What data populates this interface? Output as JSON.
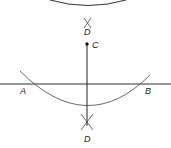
{
  "diagram": {
    "title": "",
    "labels": {
      "A": "A",
      "B": "B",
      "C": "C",
      "D_upper": "D",
      "D_lower": "D"
    },
    "colors": {
      "stroke": "#333333",
      "background": "#ffffff"
    },
    "elements": [
      {
        "type": "arc",
        "name": "top-arc",
        "description": "arc centered below, drawn at top edge"
      },
      {
        "type": "line",
        "name": "horizontal-line-AB"
      },
      {
        "type": "arc",
        "name": "arc-through-A-and-B",
        "center": "C"
      },
      {
        "type": "segment",
        "name": "vertical-line-C-to-D"
      },
      {
        "type": "point",
        "name": "point-C"
      },
      {
        "type": "arc-intersection-mark",
        "name": "upper-D-mark"
      },
      {
        "type": "arc-intersection-mark",
        "name": "lower-D-mark"
      }
    ]
  }
}
